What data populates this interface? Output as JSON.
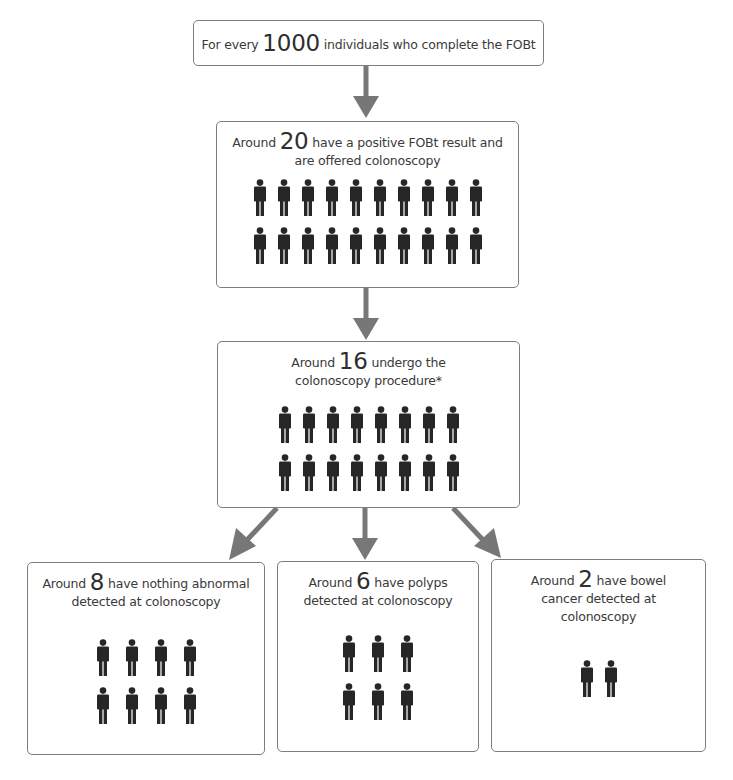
{
  "colors": {
    "arrow": "#777777",
    "person": "#262626",
    "box_border": "#7d7d7d"
  },
  "flow": {
    "step1": {
      "prefix": "For every",
      "number": "1000",
      "suffix": "individuals who complete the FOBt"
    },
    "step2": {
      "prefix": "Around",
      "number": "20",
      "suffix": "have a positive FOBt result and are offered colonoscopy",
      "icon_count": 20,
      "icon_rows": 2,
      "icon_cols": 10
    },
    "step3": {
      "prefix": "Around",
      "number": "16",
      "suffix": "undergo the colonoscopy procedure*",
      "icon_count": 16,
      "icon_rows": 2,
      "icon_cols": 8
    },
    "outcomes": [
      {
        "prefix": "Around",
        "number": "8",
        "suffix": "have nothing abnormal detected at colonoscopy",
        "icon_count": 8,
        "icon_rows": 2,
        "icon_cols": 4
      },
      {
        "prefix": "Around",
        "number": "6",
        "suffix": "have polyps detected at colonoscopy",
        "icon_count": 6,
        "icon_rows": 2,
        "icon_cols": 3
      },
      {
        "prefix": "Around",
        "number": "2",
        "suffix": "have bowel cancer detected at colonoscopy",
        "icon_count": 2,
        "icon_rows": 1,
        "icon_cols": 2
      }
    ]
  }
}
